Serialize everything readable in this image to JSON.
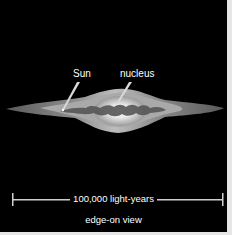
{
  "figure": {
    "background_color": "#000000",
    "border_color": "#e6e6e6",
    "labels": {
      "sun": "Sun",
      "nucleus": "nucleus"
    },
    "scale_bar": {
      "label": "100,000 light-years",
      "color": "#cfcfcf"
    },
    "caption": "edge-on view"
  }
}
